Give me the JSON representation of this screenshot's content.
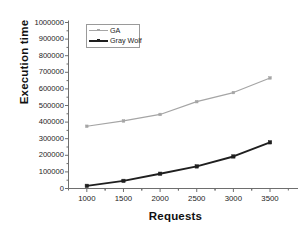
{
  "chart_data": {
    "type": "line",
    "title": "",
    "xlabel": "Requests",
    "ylabel": "Execution time",
    "x": [
      1000,
      1500,
      2000,
      2500,
      3000,
      3500
    ],
    "xticklabels": [
      "1000",
      "1500",
      "2000",
      "2500",
      "3000",
      "3500"
    ],
    "yticks": [
      0,
      100000,
      200000,
      300000,
      400000,
      500000,
      600000,
      700000,
      800000,
      900000,
      1000000
    ],
    "yticklabels": [
      "0",
      "100000",
      "200000",
      "300000",
      "400000",
      "500000",
      "600000",
      "700000",
      "800000",
      "900000",
      "1000000"
    ],
    "xlim": [
      750,
      3800
    ],
    "ylim": [
      0,
      1000000
    ],
    "grid": false,
    "legend_position": "upper-left-inside",
    "series": [
      {
        "name": "GA",
        "color": "#a5a5a5",
        "marker": "square",
        "values": [
          375000,
          407000,
          446000,
          523000,
          578000,
          666000
        ]
      },
      {
        "name": "Gray Wolf",
        "color": "#1f1f1f",
        "marker": "square",
        "values": [
          16000,
          46000,
          89000,
          133000,
          193000,
          278000
        ]
      }
    ]
  },
  "legend": {
    "items": [
      {
        "label": "GA"
      },
      {
        "label": "Gray Wolf"
      }
    ]
  },
  "axis": {
    "color": "#6e6e6e"
  }
}
